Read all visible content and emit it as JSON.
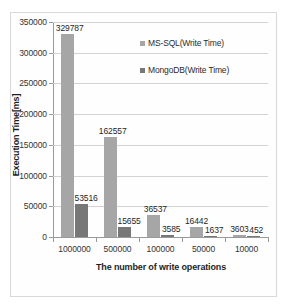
{
  "chart_data": {
    "type": "bar",
    "title": "",
    "xlabel": "The number of write operations",
    "ylabel": "Execution Time[ms]",
    "categories": [
      "1000000",
      "500000",
      "100000",
      "50000",
      "10000"
    ],
    "series": [
      {
        "name": "MS-SQL(Write Time)",
        "color": "#a6a6a6",
        "values": [
          329787,
          162557,
          36537,
          16442,
          3603
        ],
        "labels": [
          "329787",
          "162557",
          "36537",
          "16442",
          "3603"
        ]
      },
      {
        "name": "MongoDB(Write Time)",
        "color": "#777777",
        "values": [
          53516,
          15655,
          3585,
          1637,
          452
        ],
        "labels": [
          "53516",
          "15655",
          "3585",
          "1637",
          "452"
        ]
      }
    ],
    "ylim": [
      0,
      350000
    ],
    "yticks": [
      0,
      50000,
      100000,
      150000,
      200000,
      250000,
      300000,
      350000
    ],
    "ytick_labels": [
      "0",
      "50000",
      "100000",
      "150000",
      "200000",
      "250000",
      "300000",
      "350000"
    ],
    "grid": true,
    "legend_position": "inside-upper-center"
  }
}
